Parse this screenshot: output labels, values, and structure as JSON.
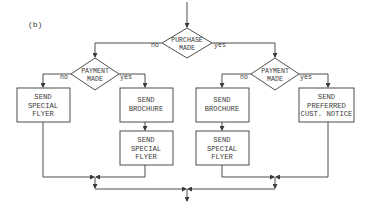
{
  "panel_label": "(b)",
  "decisions": {
    "purchase": {
      "line1": "PURCHASE",
      "line2": "MADE",
      "no": "no",
      "yes": "yes"
    },
    "payment_left": {
      "line1": "PAYMENT",
      "line2": "MADE",
      "no": "no",
      "yes": "yes"
    },
    "payment_right": {
      "line1": "PAYMENT",
      "line2": "MADE",
      "no": "no",
      "yes": "yes"
    }
  },
  "boxes": {
    "left_no": {
      "line1": "SEND",
      "line2": "SPECIAL",
      "line3": "FLYER"
    },
    "left_yes_1": {
      "line1": "SEND",
      "line2": "BROCHURE"
    },
    "left_yes_2": {
      "line1": "SEND",
      "line2": "SPECIAL",
      "line3": "FLYER"
    },
    "right_no_1": {
      "line1": "SEND",
      "line2": "BROCHURE"
    },
    "right_no_2": {
      "line1": "SEND",
      "line2": "SPECIAL",
      "line3": "FLYER"
    },
    "right_yes": {
      "line1": "SEND",
      "line2": "PREFERRED",
      "line3": "CUST. NOTICE"
    }
  },
  "colors": {
    "ink": "#3a3a3a",
    "background": "#ffffff"
  }
}
